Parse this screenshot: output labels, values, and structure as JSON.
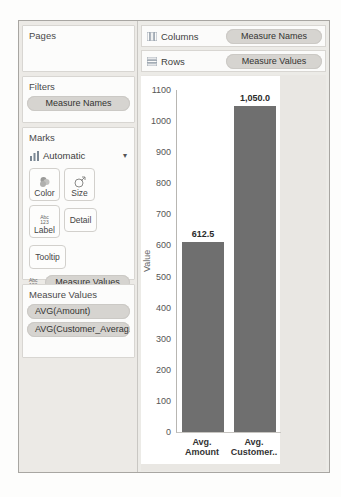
{
  "shelves": {
    "columns": {
      "label": "Columns",
      "pill": "Measure Names"
    },
    "rows": {
      "label": "Rows",
      "pill": "Measure Values"
    }
  },
  "sidebar": {
    "pages": {
      "title": "Pages"
    },
    "filters": {
      "title": "Filters",
      "pill": "Measure Names"
    },
    "marks": {
      "title": "Marks",
      "mark_type_label": "Automatic",
      "buttons": [
        {
          "label": "Color"
        },
        {
          "label": "Size"
        },
        {
          "label": "Label"
        },
        {
          "label": "Detail"
        },
        {
          "label": "Tooltip"
        }
      ],
      "pill": "Measure Values"
    },
    "measure_values": {
      "title": "Measure Values",
      "pills": [
        "AVG(Amount)",
        "AVG(Customer_Averag.."
      ]
    }
  },
  "icons": {
    "caret_down": "▾",
    "abc123_line1": "Abc",
    "abc123_line2": "123"
  },
  "chart_data": {
    "type": "bar",
    "title": "",
    "categories": [
      "Avg. Amount",
      "Avg. Customer.."
    ],
    "category_lines": [
      [
        "Avg.",
        "Amount"
      ],
      [
        "Avg.",
        "Customer.."
      ]
    ],
    "values": [
      612.5,
      1050.0
    ],
    "value_labels": [
      "612.5",
      "1,050.0"
    ],
    "xlabel": "",
    "ylabel": "Value",
    "ylim": [
      0,
      1100
    ],
    "ytick_step": 100,
    "grid": false,
    "legend": "none",
    "bar_color": "#6f6f6f"
  },
  "colors": {
    "bar": "#6f6f6f",
    "pill_bg": "#d6d4d0",
    "card_bg": "#fcfcfb",
    "panel_bg": "#ecebe7",
    "worksheet_bg": "#e9e7e3",
    "chart_bg": "#ffffff",
    "border": "#c9c7c3",
    "text": "#3c3c3c"
  }
}
